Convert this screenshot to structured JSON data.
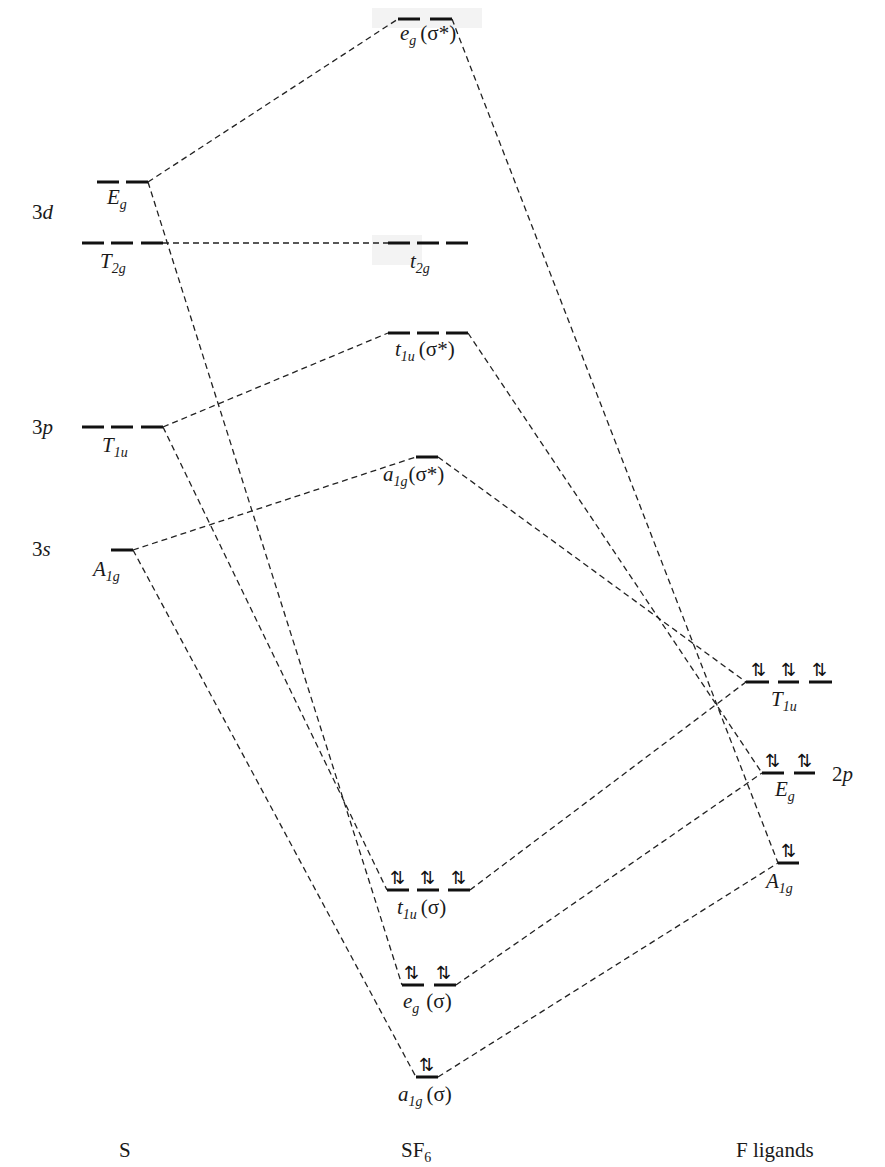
{
  "diagram": {
    "type": "molecular-orbital-energy-diagram",
    "columns": [
      {
        "id": "S",
        "label": "S"
      },
      {
        "id": "SF6",
        "label_main": "SF",
        "label_sub": "6"
      },
      {
        "id": "F",
        "label": "F ligands"
      }
    ],
    "atomic_labels": {
      "s3d": {
        "num": "3",
        "letter": "d"
      },
      "s3p": {
        "num": "3",
        "letter": "p"
      },
      "s3s": {
        "num": "3",
        "letter": "s"
      },
      "f2p": {
        "num": "2",
        "letter": "p"
      }
    },
    "sulfur_orbitals": [
      {
        "id": "S_Eg",
        "sym": "E",
        "sub": "g",
        "degeneracy": 2,
        "electrons": 0
      },
      {
        "id": "S_T2g",
        "sym": "T",
        "sub": "2g",
        "degeneracy": 3,
        "electrons": 0
      },
      {
        "id": "S_T1u",
        "sym": "T",
        "sub": "1u",
        "degeneracy": 3,
        "electrons": 0
      },
      {
        "id": "S_A1g",
        "sym": "A",
        "sub": "1g",
        "degeneracy": 1,
        "electrons": 0
      }
    ],
    "sf6_orbitals": [
      {
        "id": "eg_star",
        "sym": "e",
        "sub": "g",
        "tag": "(σ*)",
        "degeneracy": 2,
        "electrons": 0
      },
      {
        "id": "t2g",
        "sym": "t",
        "sub": "2g",
        "tag": "",
        "degeneracy": 3,
        "electrons": 0
      },
      {
        "id": "t1u_star",
        "sym": "t",
        "sub": "1u",
        "tag": "(σ*)",
        "degeneracy": 3,
        "electrons": 0
      },
      {
        "id": "a1g_star",
        "sym": "a",
        "sub": "1g",
        "tag": "(σ*)",
        "degeneracy": 1,
        "electrons": 0
      },
      {
        "id": "t1u",
        "sym": "t",
        "sub": "1u",
        "tag": "(σ)",
        "degeneracy": 3,
        "electrons": 6
      },
      {
        "id": "eg",
        "sym": "e",
        "sub": "g",
        "tag": "(σ)",
        "degeneracy": 2,
        "electrons": 4
      },
      {
        "id": "a1g",
        "sym": "a",
        "sub": "1g",
        "tag": "(σ)",
        "degeneracy": 1,
        "electrons": 2
      }
    ],
    "ligand_orbitals": [
      {
        "id": "F_T1u",
        "sym": "T",
        "sub": "1u",
        "degeneracy": 3,
        "electrons": 6
      },
      {
        "id": "F_Eg",
        "sym": "E",
        "sub": "g",
        "degeneracy": 2,
        "electrons": 4
      },
      {
        "id": "F_A1g",
        "sym": "A",
        "sub": "1g",
        "degeneracy": 1,
        "electrons": 2
      }
    ],
    "electron_pair_glyph": "⇅",
    "correlations": [
      [
        "S_Eg",
        "eg_star"
      ],
      [
        "S_Eg",
        "eg"
      ],
      [
        "S_T2g",
        "t2g"
      ],
      [
        "S_T1u",
        "t1u_star"
      ],
      [
        "S_T1u",
        "t1u"
      ],
      [
        "S_A1g",
        "a1g_star"
      ],
      [
        "S_A1g",
        "a1g"
      ],
      [
        "eg_star",
        "F_Eg"
      ],
      [
        "t1u_star",
        "F_T1u"
      ],
      [
        "a1g_star",
        "F_A1g"
      ],
      [
        "t1u",
        "F_T1u"
      ],
      [
        "eg",
        "F_Eg"
      ],
      [
        "a1g",
        "F_A1g"
      ]
    ]
  }
}
